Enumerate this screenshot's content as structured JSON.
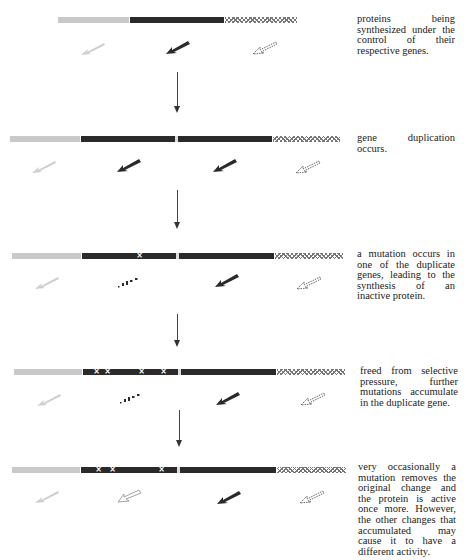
{
  "diagram": {
    "steps": [
      {
        "caption": "proteins being synthesized under the control of their respective genes.",
        "caption_lines": [
          "proteins being syn-",
          "thesized under the",
          "control of their re-",
          "spective genes."
        ],
        "gene_segments": [
          "light",
          "dark",
          "hatched"
        ],
        "proteins": [
          "light-arrow",
          "dark-arrow",
          "hatched-arrow"
        ],
        "mutation_count": 0
      },
      {
        "caption": "gene duplication occurs.",
        "caption_lines": [
          "gene duplication oc-",
          "curs."
        ],
        "gene_segments": [
          "light",
          "dark",
          "dark",
          "hatched"
        ],
        "proteins": [
          "light-arrow",
          "dark-arrow",
          "dark-arrow",
          "hatched-arrow"
        ],
        "mutation_count": 0
      },
      {
        "caption": "a mutation occurs in one of the duplicate genes, leading to the synthesis of an inactive protein.",
        "caption_lines": [
          "a mutation occurs",
          "in one of the dupli-",
          "cate genes, leading",
          "to the synthesis of an",
          "inactive protein."
        ],
        "gene_segments": [
          "light",
          "dark-mutated",
          "dark",
          "hatched"
        ],
        "proteins": [
          "light-arrow",
          "broken-arrow",
          "dark-arrow",
          "hatched-arrow"
        ],
        "mutation_count": 1
      },
      {
        "caption": "freed from selective pressure, further mutations accumulate in the duplicate gene.",
        "caption_lines": [
          "freed from selective",
          "pressure, further mu-",
          "tations accumulate in",
          "the duplicate gene."
        ],
        "gene_segments": [
          "light",
          "dark-mutated",
          "dark",
          "hatched"
        ],
        "proteins": [
          "light-arrow",
          "broken-arrow",
          "dark-arrow",
          "hatched-arrow"
        ],
        "mutation_count": 4
      },
      {
        "caption": "very occasionally a mutation removes the original change and the protein is active once more. However, the other changes that accumulated may cause it to have a different activity.",
        "caption_lines": [
          "very occasionally a",
          "mutation removes the",
          "original change and",
          "the protein is active",
          "once more. However,",
          "the other changes",
          "that accumulated may",
          "cause it to have a",
          "different activity."
        ],
        "gene_segments": [
          "light",
          "dark-mutated",
          "dark",
          "hatched"
        ],
        "proteins": [
          "light-arrow",
          "outline-arrow",
          "dark-arrow",
          "hatched-arrow"
        ],
        "mutation_count": 3
      }
    ],
    "mutation_symbol": "×",
    "colors": {
      "light_gene": "#c9c9c9",
      "dark_gene": "#2a2a2a",
      "hatch_gene": "#777777",
      "text": "#222222"
    }
  }
}
